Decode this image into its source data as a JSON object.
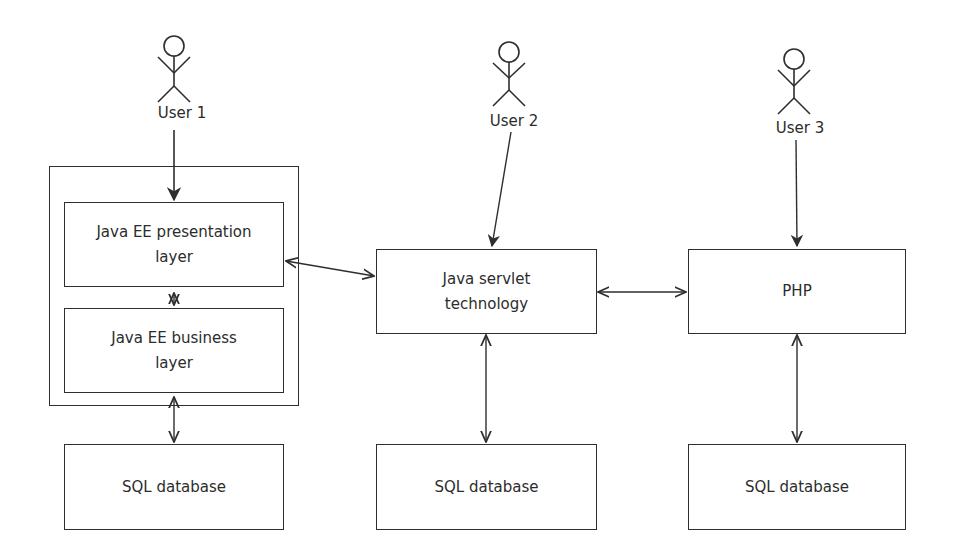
{
  "diagram": {
    "actors": [
      {
        "id": "user1",
        "label": "User 1"
      },
      {
        "id": "user2",
        "label": "User 2"
      },
      {
        "id": "user3",
        "label": "User 3"
      }
    ],
    "container": {
      "id": "java-ee",
      "label": ""
    },
    "nodes": [
      {
        "id": "javaee-presentation",
        "label": "Java EE presentation layer",
        "line1": "Java EE presentation",
        "line2": "layer"
      },
      {
        "id": "javaee-business",
        "label": "Java EE business layer",
        "line1": "Java EE business",
        "line2": "layer"
      },
      {
        "id": "servlet",
        "label": "Java servlet technology",
        "line1": "Java servlet",
        "line2": "technology"
      },
      {
        "id": "php",
        "label": "PHP",
        "line1": "PHP",
        "line2": ""
      },
      {
        "id": "sql1",
        "label": "SQL database",
        "line1": "SQL database",
        "line2": ""
      },
      {
        "id": "sql2",
        "label": "SQL database",
        "line1": "SQL database",
        "line2": ""
      },
      {
        "id": "sql3",
        "label": "SQL database",
        "line1": "SQL database",
        "line2": ""
      }
    ],
    "edges": [
      {
        "from": "user1",
        "to": "javaee-presentation",
        "type": "directed"
      },
      {
        "from": "user2",
        "to": "servlet",
        "type": "directed"
      },
      {
        "from": "user3",
        "to": "php",
        "type": "directed"
      },
      {
        "from": "javaee-presentation",
        "to": "javaee-business",
        "type": "bidirectional"
      },
      {
        "from": "javaee-presentation",
        "to": "servlet",
        "type": "bidirectional"
      },
      {
        "from": "servlet",
        "to": "php",
        "type": "bidirectional"
      },
      {
        "from": "java-ee",
        "to": "sql1",
        "type": "bidirectional"
      },
      {
        "from": "servlet",
        "to": "sql2",
        "type": "bidirectional"
      },
      {
        "from": "php",
        "to": "sql3",
        "type": "bidirectional"
      }
    ],
    "colors": {
      "stroke": "#2e2e2e",
      "text": "#2c2c2c",
      "background": "#ffffff"
    }
  }
}
